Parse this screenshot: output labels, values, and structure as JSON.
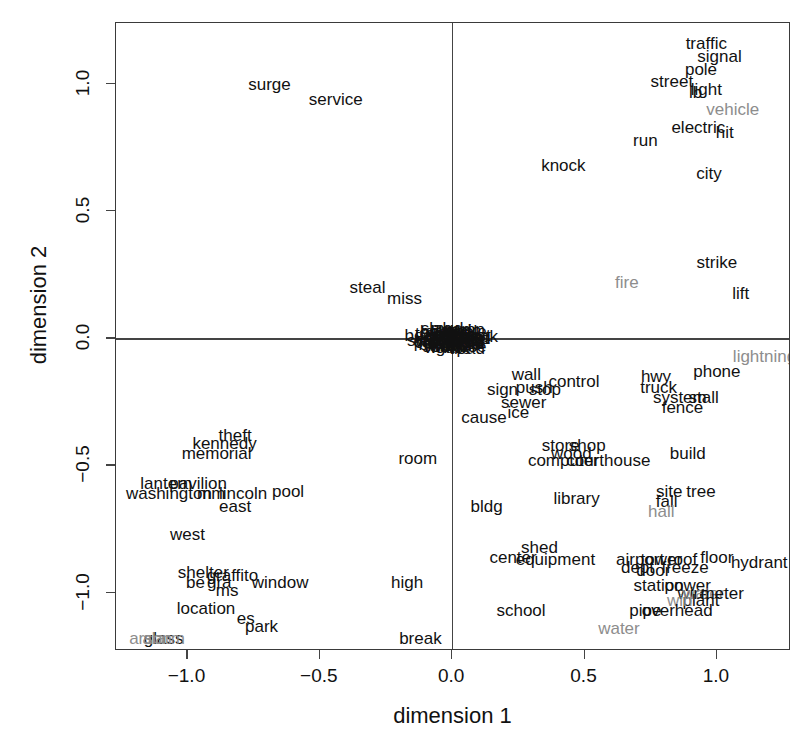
{
  "chart_data": {
    "type": "scatter",
    "title": "",
    "xlabel": "dimension 1",
    "ylabel": "dimension 2",
    "xlim": [
      -1.27,
      1.28
    ],
    "ylim": [
      -1.23,
      1.24
    ],
    "xticks": [
      "-1.0",
      "-0.5",
      "0.0",
      "0.5",
      "1.0"
    ],
    "xtickvals": [
      -1.0,
      -0.5,
      0.0,
      0.5,
      1.0
    ],
    "yticks": [
      "-1.0",
      "-0.5",
      "0.0",
      "0.5",
      "1.0"
    ],
    "ytickvals": [
      -1.0,
      -0.5,
      0.0,
      0.5,
      1.0
    ],
    "grid": false,
    "legend": "none",
    "marker_style": "text-labels",
    "reference_lines": {
      "x": 0.0,
      "y": 0.0
    },
    "colors": {
      "primary": "#111111",
      "highlight": "#8d8d8d",
      "axis": "#444444"
    },
    "points": [
      {
        "label": "surge",
        "x": -0.69,
        "y": 1.0,
        "color": "primary"
      },
      {
        "label": "service",
        "x": -0.44,
        "y": 0.94,
        "color": "primary"
      },
      {
        "label": "steal",
        "x": -0.32,
        "y": 0.2,
        "color": "primary"
      },
      {
        "label": "miss",
        "x": -0.18,
        "y": 0.16,
        "color": "primary"
      },
      {
        "label": "traffic",
        "x": 0.96,
        "y": 1.16,
        "color": "primary"
      },
      {
        "label": "signal",
        "x": 1.01,
        "y": 1.11,
        "color": "primary"
      },
      {
        "label": "pole",
        "x": 0.94,
        "y": 1.06,
        "color": "primary"
      },
      {
        "label": "street",
        "x": 0.83,
        "y": 1.01,
        "color": "primary"
      },
      {
        "label": "light",
        "x": 0.96,
        "y": 0.98,
        "color": "primary"
      },
      {
        "label": "lb",
        "x": 0.92,
        "y": 0.97,
        "color": "primary"
      },
      {
        "label": "vehicle",
        "x": 1.06,
        "y": 0.9,
        "color": "highlight"
      },
      {
        "label": "electric",
        "x": 0.93,
        "y": 0.83,
        "color": "primary"
      },
      {
        "label": "hit",
        "x": 1.03,
        "y": 0.81,
        "color": "primary"
      },
      {
        "label": "run",
        "x": 0.73,
        "y": 0.78,
        "color": "primary"
      },
      {
        "label": "knock",
        "x": 0.42,
        "y": 0.68,
        "color": "primary"
      },
      {
        "label": "city",
        "x": 0.97,
        "y": 0.65,
        "color": "primary"
      },
      {
        "label": "strike",
        "x": 1.0,
        "y": 0.3,
        "color": "primary"
      },
      {
        "label": "fire",
        "x": 0.66,
        "y": 0.22,
        "color": "highlight"
      },
      {
        "label": "lift",
        "x": 1.09,
        "y": 0.18,
        "color": "primary"
      },
      {
        "label": "lightning",
        "x": 1.18,
        "y": -0.07,
        "color": "highlight"
      },
      {
        "label": "phone",
        "x": 1.0,
        "y": -0.13,
        "color": "primary"
      },
      {
        "label": "wall",
        "x": 0.28,
        "y": -0.14,
        "color": "primary"
      },
      {
        "label": "hwy",
        "x": 0.77,
        "y": -0.15,
        "color": "primary"
      },
      {
        "label": "control",
        "x": 0.46,
        "y": -0.17,
        "color": "primary"
      },
      {
        "label": "push",
        "x": 0.31,
        "y": -0.19,
        "color": "primary"
      },
      {
        "label": "truck",
        "x": 0.78,
        "y": -0.19,
        "color": "primary"
      },
      {
        "label": "sign",
        "x": 0.19,
        "y": -0.2,
        "color": "primary"
      },
      {
        "label": "stop",
        "x": 0.35,
        "y": -0.2,
        "color": "primary"
      },
      {
        "label": "system",
        "x": 0.86,
        "y": -0.23,
        "color": "primary"
      },
      {
        "label": "stall",
        "x": 0.95,
        "y": -0.23,
        "color": "primary"
      },
      {
        "label": "sewer",
        "x": 0.27,
        "y": -0.25,
        "color": "primary"
      },
      {
        "label": "fence",
        "x": 0.87,
        "y": -0.27,
        "color": "primary"
      },
      {
        "label": "ice",
        "x": 0.25,
        "y": -0.29,
        "color": "primary"
      },
      {
        "label": "cause",
        "x": 0.12,
        "y": -0.31,
        "color": "primary"
      },
      {
        "label": "theft",
        "x": -0.82,
        "y": -0.38,
        "color": "primary"
      },
      {
        "label": "kennedy",
        "x": -0.86,
        "y": -0.41,
        "color": "primary"
      },
      {
        "label": "memorial",
        "x": -0.89,
        "y": -0.45,
        "color": "primary"
      },
      {
        "label": "store",
        "x": 0.41,
        "y": -0.42,
        "color": "primary"
      },
      {
        "label": "shop",
        "x": 0.51,
        "y": -0.42,
        "color": "primary"
      },
      {
        "label": "wood",
        "x": 0.45,
        "y": -0.45,
        "color": "primary"
      },
      {
        "label": "build",
        "x": 0.89,
        "y": -0.45,
        "color": "primary"
      },
      {
        "label": "room",
        "x": -0.13,
        "y": -0.47,
        "color": "primary"
      },
      {
        "label": "computer",
        "x": 0.42,
        "y": -0.48,
        "color": "primary"
      },
      {
        "label": "courthouse",
        "x": 0.59,
        "y": -0.48,
        "color": "primary"
      },
      {
        "label": "lantern",
        "x": -1.08,
        "y": -0.57,
        "color": "primary"
      },
      {
        "label": "pavilion",
        "x": -0.96,
        "y": -0.57,
        "color": "primary"
      },
      {
        "label": "washington",
        "x": -1.07,
        "y": -0.61,
        "color": "primary"
      },
      {
        "label": "mm",
        "x": -0.91,
        "y": -0.61,
        "color": "primary"
      },
      {
        "label": "lincoln",
        "x": -0.79,
        "y": -0.61,
        "color": "primary"
      },
      {
        "label": "pool",
        "x": -0.62,
        "y": -0.6,
        "color": "primary"
      },
      {
        "label": "site",
        "x": 0.82,
        "y": -0.6,
        "color": "primary"
      },
      {
        "label": "tree",
        "x": 0.94,
        "y": -0.6,
        "color": "primary"
      },
      {
        "label": "library",
        "x": 0.47,
        "y": -0.63,
        "color": "primary"
      },
      {
        "label": "fall",
        "x": 0.81,
        "y": -0.64,
        "color": "primary"
      },
      {
        "label": "bldg",
        "x": 0.13,
        "y": -0.66,
        "color": "primary"
      },
      {
        "label": "east",
        "x": -0.82,
        "y": -0.66,
        "color": "primary"
      },
      {
        "label": "hall",
        "x": 0.79,
        "y": -0.68,
        "color": "highlight"
      },
      {
        "label": "west",
        "x": -1.0,
        "y": -0.77,
        "color": "primary"
      },
      {
        "label": "shed",
        "x": 0.33,
        "y": -0.82,
        "color": "primary"
      },
      {
        "label": "center",
        "x": 0.23,
        "y": -0.86,
        "color": "primary"
      },
      {
        "label": "equipment",
        "x": 0.39,
        "y": -0.87,
        "color": "primary"
      },
      {
        "label": "airport",
        "x": 0.71,
        "y": -0.87,
        "color": "primary"
      },
      {
        "label": "tower",
        "x": 0.79,
        "y": -0.87,
        "color": "primary"
      },
      {
        "label": "roof",
        "x": 0.87,
        "y": -0.87,
        "color": "primary"
      },
      {
        "label": "floor",
        "x": 1.0,
        "y": -0.86,
        "color": "primary"
      },
      {
        "label": "hydrant",
        "x": 1.16,
        "y": -0.88,
        "color": "primary"
      },
      {
        "label": "dept",
        "x": 0.7,
        "y": -0.9,
        "color": "primary"
      },
      {
        "label": "door",
        "x": 0.76,
        "y": -0.91,
        "color": "primary"
      },
      {
        "label": "freeze",
        "x": 0.88,
        "y": -0.9,
        "color": "primary"
      },
      {
        "label": "shelter",
        "x": -0.94,
        "y": -0.92,
        "color": "primary"
      },
      {
        "label": "graffito",
        "x": -0.83,
        "y": -0.93,
        "color": "primary"
      },
      {
        "label": "be",
        "x": -0.97,
        "y": -0.96,
        "color": "primary"
      },
      {
        "label": "gra",
        "x": -0.88,
        "y": -0.96,
        "color": "primary"
      },
      {
        "label": "window",
        "x": -0.65,
        "y": -0.96,
        "color": "primary"
      },
      {
        "label": "ms",
        "x": -0.85,
        "y": -0.99,
        "color": "primary"
      },
      {
        "label": "high",
        "x": -0.17,
        "y": -0.96,
        "color": "primary"
      },
      {
        "label": "station",
        "x": 0.78,
        "y": -0.97,
        "color": "primary"
      },
      {
        "label": "power",
        "x": 0.89,
        "y": -0.97,
        "color": "primary"
      },
      {
        "label": "wire",
        "x": 0.91,
        "y": -1.0,
        "color": "primary"
      },
      {
        "label": "water",
        "x": 0.95,
        "y": -1.0,
        "color": "highlight"
      },
      {
        "label": "meter",
        "x": 1.02,
        "y": -1.0,
        "color": "primary"
      },
      {
        "label": "plant",
        "x": 0.94,
        "y": -1.03,
        "color": "primary"
      },
      {
        "label": "win",
        "x": 0.86,
        "y": -1.03,
        "color": "highlight"
      },
      {
        "label": "location",
        "x": -0.93,
        "y": -1.06,
        "color": "primary"
      },
      {
        "label": "pipe",
        "x": 0.73,
        "y": -1.07,
        "color": "primary"
      },
      {
        "label": "overhead",
        "x": 0.85,
        "y": -1.07,
        "color": "primary"
      },
      {
        "label": "school",
        "x": 0.26,
        "y": -1.07,
        "color": "primary"
      },
      {
        "label": "es",
        "x": -0.78,
        "y": -1.1,
        "color": "primary"
      },
      {
        "label": "park",
        "x": -0.72,
        "y": -1.13,
        "color": "primary"
      },
      {
        "label": "water",
        "x": 0.63,
        "y": -1.14,
        "color": "highlight"
      },
      {
        "label": "glass",
        "x": -1.09,
        "y": -1.18,
        "color": "primary"
      },
      {
        "label": "alarm",
        "x": -1.09,
        "y": -1.18,
        "color": "highlight"
      },
      {
        "label": "arson",
        "x": -1.14,
        "y": -1.18,
        "color": "highlight"
      },
      {
        "label": "break",
        "x": -0.12,
        "y": -1.18,
        "color": "primary"
      },
      {
        "label": "van",
        "x": -0.04,
        "y": 0.018,
        "color": "primary"
      },
      {
        "label": "dust",
        "x": 0.0,
        "y": 0.02,
        "color": "primary"
      },
      {
        "label": "bus",
        "x": 0.035,
        "y": 0.016,
        "color": "primary"
      },
      {
        "label": "old",
        "x": 0.075,
        "y": -0.01,
        "color": "primary"
      },
      {
        "label": "cut",
        "x": -0.06,
        "y": 0.01,
        "color": "primary"
      },
      {
        "label": "car",
        "x": -0.02,
        "y": -0.008,
        "color": "primary"
      },
      {
        "label": "road",
        "x": 0.02,
        "y": -0.012,
        "color": "primary"
      },
      {
        "label": "box",
        "x": -0.075,
        "y": -0.022,
        "color": "primary"
      },
      {
        "label": "pole",
        "x": 0.05,
        "y": -0.024,
        "color": "primary"
      },
      {
        "label": "wire",
        "x": -0.05,
        "y": -0.026,
        "color": "primary"
      },
      {
        "label": "sewer",
        "x": 0.01,
        "y": -0.03,
        "color": "primary"
      },
      {
        "label": "drain",
        "x": -0.03,
        "y": 0.03,
        "color": "primary"
      },
      {
        "label": "main",
        "x": 0.04,
        "y": 0.032,
        "color": "primary"
      },
      {
        "label": "line",
        "x": -0.09,
        "y": 0.004,
        "color": "primary"
      },
      {
        "label": "pit",
        "x": 0.065,
        "y": 0.006,
        "color": "primary"
      },
      {
        "label": "gas",
        "x": -0.01,
        "y": -0.034,
        "color": "primary"
      },
      {
        "label": "leak",
        "x": 0.03,
        "y": -0.002,
        "color": "primary"
      },
      {
        "label": "pump",
        "x": -0.065,
        "y": -0.016,
        "color": "primary"
      },
      {
        "label": "tank",
        "x": 0.055,
        "y": -0.018,
        "color": "primary"
      },
      {
        "label": "snow",
        "x": -0.045,
        "y": 0.024,
        "color": "primary"
      },
      {
        "label": "rain",
        "x": 0.015,
        "y": 0.026,
        "color": "primary"
      },
      {
        "label": "wind",
        "x": 0.08,
        "y": 0.002,
        "color": "primary"
      },
      {
        "label": "tree",
        "x": -0.085,
        "y": 0.022,
        "color": "primary"
      },
      {
        "label": "limb",
        "x": 0.045,
        "y": -0.006,
        "color": "primary"
      },
      {
        "label": "curb",
        "x": -0.015,
        "y": 0.006,
        "color": "primary"
      },
      {
        "label": "hole",
        "x": 0.07,
        "y": 0.028,
        "color": "primary"
      },
      {
        "label": "sink",
        "x": -0.055,
        "y": -0.03,
        "color": "primary"
      },
      {
        "label": "lid",
        "x": 0.09,
        "y": -0.02,
        "color": "primary"
      },
      {
        "label": "cap",
        "x": -0.095,
        "y": -0.012,
        "color": "primary"
      },
      {
        "label": "duct",
        "x": 0.025,
        "y": 0.012,
        "color": "primary"
      },
      {
        "label": "vent",
        "x": -0.035,
        "y": -0.02,
        "color": "primary"
      },
      {
        "label": "hose",
        "x": 0.06,
        "y": -0.032,
        "color": "primary"
      },
      {
        "label": "belt",
        "x": -0.07,
        "y": 0.028,
        "color": "primary"
      },
      {
        "label": "rail",
        "x": 0.0,
        "y": -0.026,
        "color": "primary"
      },
      {
        "label": "post",
        "x": 0.085,
        "y": 0.014,
        "color": "primary"
      },
      {
        "label": "sign",
        "x": -0.025,
        "y": -0.014,
        "color": "primary"
      },
      {
        "label": "gate",
        "x": 0.04,
        "y": 0.004,
        "color": "primary"
      },
      {
        "label": "well",
        "x": -0.08,
        "y": -0.004,
        "color": "primary"
      },
      {
        "label": "yard",
        "x": 0.01,
        "y": 0.034,
        "color": "primary"
      },
      {
        "label": "walk",
        "x": -0.04,
        "y": -0.036,
        "color": "primary"
      },
      {
        "label": "ramp",
        "x": 0.05,
        "y": 0.036,
        "color": "primary"
      },
      {
        "label": "beam",
        "x": -0.1,
        "y": 0.014,
        "color": "primary"
      },
      {
        "label": "dirt",
        "x": 0.095,
        "y": 0.0,
        "color": "primary"
      },
      {
        "label": "mud",
        "x": -0.02,
        "y": 0.04,
        "color": "primary"
      },
      {
        "label": "tile",
        "x": 0.03,
        "y": -0.04,
        "color": "primary"
      },
      {
        "label": "slab",
        "x": -0.06,
        "y": 0.04,
        "color": "primary"
      },
      {
        "label": "pad",
        "x": 0.07,
        "y": -0.038,
        "color": "primary"
      },
      {
        "label": "step",
        "x": -0.11,
        "y": -0.008,
        "color": "primary"
      },
      {
        "label": "deck",
        "x": 0.105,
        "y": 0.01,
        "color": "primary"
      }
    ]
  }
}
